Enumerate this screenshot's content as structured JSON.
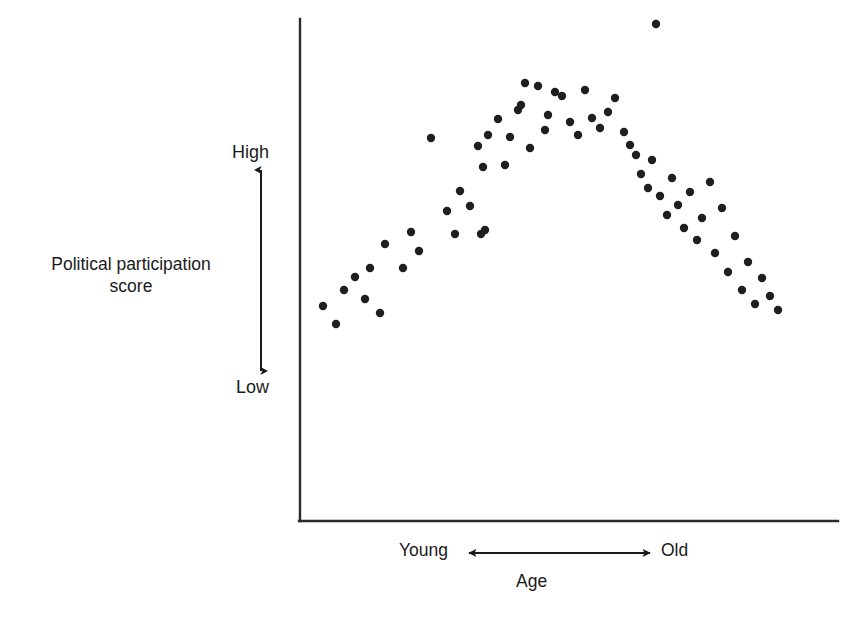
{
  "chart_data": {
    "type": "scatter",
    "title": "",
    "xlabel": "Age",
    "ylabel": "Political participation score",
    "x_axis_low_label": "Young",
    "x_axis_high_label": "Old",
    "y_axis_low_label": "Low",
    "y_axis_high_label": "High",
    "grid": false,
    "legend": "none",
    "xlim": [
      0,
      100
    ],
    "ylim": [
      0,
      100
    ],
    "axis_ticks": "none",
    "point_color": "#1f1f1f",
    "axis_color": "#2b2b2b",
    "background_color": "#ffffff",
    "point_count": 62,
    "points": [
      [
        323,
        306
      ],
      [
        336,
        324
      ],
      [
        344,
        290
      ],
      [
        355,
        277
      ],
      [
        365,
        299
      ],
      [
        370,
        268
      ],
      [
        380,
        313
      ],
      [
        385,
        244
      ],
      [
        403,
        268
      ],
      [
        411,
        232
      ],
      [
        419,
        251
      ],
      [
        431,
        138
      ],
      [
        447,
        211
      ],
      [
        455,
        234
      ],
      [
        460,
        191
      ],
      [
        470,
        206
      ],
      [
        478,
        146
      ],
      [
        481,
        234
      ],
      [
        483,
        167
      ],
      [
        485,
        230
      ],
      [
        488,
        135
      ],
      [
        498,
        119
      ],
      [
        505,
        165
      ],
      [
        510,
        137
      ],
      [
        518,
        110
      ],
      [
        521,
        105
      ],
      [
        525,
        83
      ],
      [
        530,
        148
      ],
      [
        538,
        86
      ],
      [
        545,
        130
      ],
      [
        548,
        115
      ],
      [
        555,
        92
      ],
      [
        562,
        96
      ],
      [
        570,
        122
      ],
      [
        578,
        135
      ],
      [
        585,
        90
      ],
      [
        592,
        118
      ],
      [
        600,
        128
      ],
      [
        608,
        112
      ],
      [
        615,
        98
      ],
      [
        624,
        132
      ],
      [
        630,
        145
      ],
      [
        636,
        155
      ],
      [
        641,
        174
      ],
      [
        648,
        188
      ],
      [
        652,
        160
      ],
      [
        656,
        24
      ],
      [
        660,
        196
      ],
      [
        667,
        215
      ],
      [
        672,
        178
      ],
      [
        678,
        205
      ],
      [
        684,
        228
      ],
      [
        690,
        192
      ],
      [
        697,
        240
      ],
      [
        702,
        218
      ],
      [
        710,
        182
      ],
      [
        715,
        253
      ],
      [
        722,
        208
      ],
      [
        728,
        272
      ],
      [
        735,
        236
      ],
      [
        742,
        290
      ],
      [
        748,
        262
      ],
      [
        755,
        304
      ],
      [
        762,
        278
      ],
      [
        770,
        296
      ],
      [
        778,
        310
      ]
    ]
  },
  "axes": {
    "y_axis": {
      "x": 300,
      "y_top": 19,
      "y_bottom": 521
    },
    "x_axis": {
      "y": 521,
      "x_left": 300,
      "x_right": 838
    }
  },
  "indicators": {
    "vertical_arrow": {
      "x": 261,
      "y_top": 170,
      "y_bottom": 371
    },
    "horizontal_arrow": {
      "y": 553,
      "x_left": 469,
      "x_right": 650
    }
  }
}
